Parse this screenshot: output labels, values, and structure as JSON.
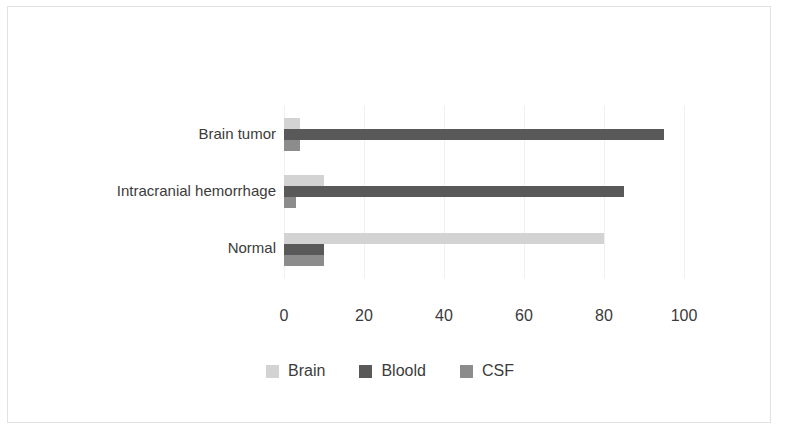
{
  "chart_data": {
    "type": "bar",
    "orientation": "horizontal",
    "title": "",
    "xlabel": "",
    "ylabel": "",
    "xlim": [
      0,
      100
    ],
    "xticks": [
      0,
      20,
      40,
      60,
      80,
      100
    ],
    "grid": true,
    "legend_position": "bottom",
    "categories": [
      "Brain tumor",
      "Intracranial hemorrhage",
      "Normal"
    ],
    "series": [
      {
        "name": "Brain",
        "color": "#d3d3d3",
        "values": [
          4,
          10,
          80
        ]
      },
      {
        "name": "Bloold",
        "color": "#595959",
        "values": [
          95,
          85,
          10
        ]
      },
      {
        "name": "CSF",
        "color": "#8c8c8c",
        "values": [
          4,
          3,
          10
        ]
      }
    ]
  },
  "axis": {
    "tick_labels": [
      "0",
      "20",
      "40",
      "60",
      "80",
      "100"
    ]
  },
  "legend": {
    "items": [
      {
        "label": "Brain",
        "color": "#d3d3d3"
      },
      {
        "label": "Bloold",
        "color": "#595959"
      },
      {
        "label": "CSF",
        "color": "#8c8c8c"
      }
    ]
  },
  "colors": {
    "frame_border": "#e2e2e2",
    "gridline": "#f0f0f0",
    "axis_line": "#d9d9d9",
    "text": "#3b3b3b",
    "background": "#ffffff"
  }
}
